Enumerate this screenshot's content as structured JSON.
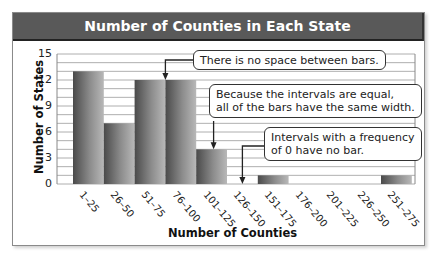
{
  "chart_data": {
    "type": "bar",
    "subtype": "histogram",
    "title": "Number of Counties in Each State",
    "xlabel": "Number of Counties",
    "ylabel": "Number of States",
    "categories": [
      "1–25",
      "26–50",
      "51–75",
      "76–100",
      "101–125",
      "126–150",
      "151–175",
      "176–200",
      "201–225",
      "226–250",
      "251–275"
    ],
    "values": [
      13,
      7,
      12,
      12,
      4,
      0,
      1,
      0,
      0,
      0,
      1
    ],
    "ylim": [
      0,
      15
    ],
    "yticks": [
      0,
      3,
      6,
      9,
      12,
      15
    ],
    "grid": {
      "horizontal": true,
      "step": 1
    },
    "legend": null,
    "annotations": [
      {
        "text": "There is no space between bars.",
        "points_to": "boundary between 51–75 and 76–100"
      },
      {
        "text": "Because the intervals are equal, all of the bars have the same width.",
        "points_to": "101–125"
      },
      {
        "text": "Intervals with a frequency of 0 have no bar.",
        "points_to": "126–150"
      }
    ]
  },
  "colors": {
    "title_bar": "#595959",
    "title_text": "#ffffff",
    "bar_dark": "#4a4a4a",
    "bar_light": "#b8b8b8",
    "grid": "#9a9a9a",
    "frame": "#8a8a8a"
  },
  "callouts": {
    "no_space": "There is no space between bars.",
    "equal_line1": "Because the intervals are equal,",
    "equal_line2": "all of the bars have the same width.",
    "zero_line1": "Intervals with a frequency",
    "zero_line2": "of 0 have no bar."
  }
}
